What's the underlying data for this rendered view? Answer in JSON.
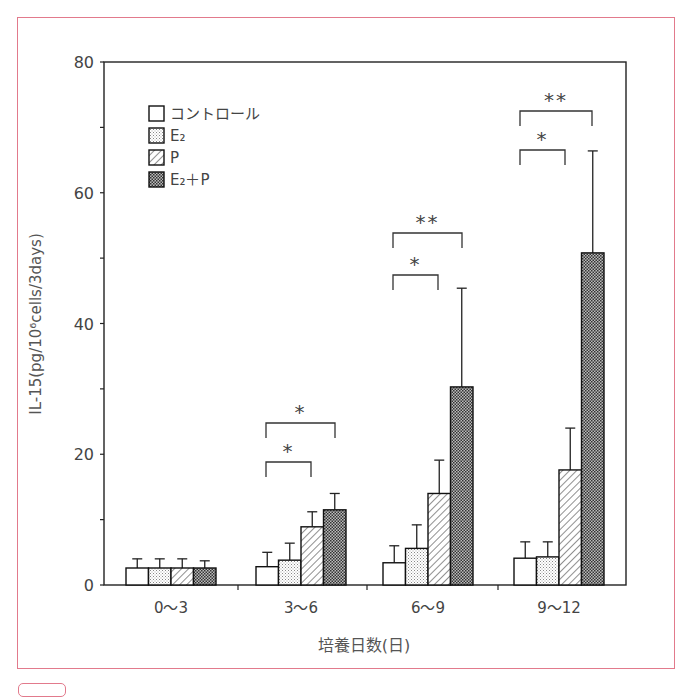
{
  "chart_data": {
    "type": "bar",
    "title": "",
    "xlabel": "培養日数(日)",
    "ylabel": "IL-15(pg/10⁶cells/3days)",
    "ylim": [
      0,
      80
    ],
    "yticks": [
      0,
      20,
      40,
      60,
      80
    ],
    "categories": [
      "0〜3",
      "3〜6",
      "6〜9",
      "9〜12"
    ],
    "grid": false,
    "legend_position": "upper-left",
    "series": [
      {
        "name": "コントロール",
        "pattern": "white",
        "values": [
          2.6,
          2.8,
          3.4,
          4.1
        ],
        "error_upper": [
          4.0,
          5.0,
          6.0,
          6.6
        ]
      },
      {
        "name": "E₂",
        "pattern": "fine-dots",
        "values": [
          2.6,
          3.8,
          5.6,
          4.3
        ],
        "error_upper": [
          4.0,
          6.4,
          9.2,
          6.6
        ]
      },
      {
        "name": "P",
        "pattern": "diagonal-hatch",
        "values": [
          2.6,
          8.9,
          14.0,
          17.6
        ],
        "error_upper": [
          4.0,
          11.2,
          19.1,
          24.0
        ]
      },
      {
        "name": "E₂＋P",
        "pattern": "dense-dots",
        "values": [
          2.6,
          11.5,
          30.3,
          50.8
        ],
        "error_upper": [
          3.7,
          14.0,
          45.4,
          66.4
        ]
      }
    ],
    "annotations": [
      {
        "group": "3〜6",
        "compare": [
          "コントロール",
          "P"
        ],
        "label": "*"
      },
      {
        "group": "3〜6",
        "compare": [
          "コントロール",
          "E₂＋P"
        ],
        "label": "*"
      },
      {
        "group": "6〜9",
        "compare": [
          "コントロール",
          "P"
        ],
        "label": "*"
      },
      {
        "group": "6〜9",
        "compare": [
          "コントロール",
          "E₂＋P"
        ],
        "label": "**"
      },
      {
        "group": "9〜12",
        "compare": [
          "コントロール",
          "P"
        ],
        "label": "*"
      },
      {
        "group": "9〜12",
        "compare": [
          "コントロール",
          "E₂＋P"
        ],
        "label": "**"
      }
    ]
  },
  "colors": {
    "frame": "#e27a8c",
    "axis": "#222222",
    "text": "#444444"
  }
}
